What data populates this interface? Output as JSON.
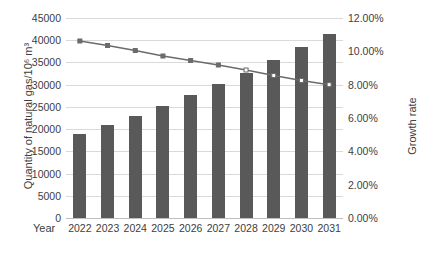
{
  "chart_data": {
    "type": "bar",
    "title": "",
    "xlabel": "Year",
    "ylabel": "Quantity of natural gas/10⁶ m³",
    "y2label": "Growth rate",
    "categories": [
      "2022",
      "2023",
      "2024",
      "2025",
      "2026",
      "2027",
      "2028",
      "2029",
      "2030",
      "2031"
    ],
    "ylim": [
      0,
      45000
    ],
    "y2lim": [
      0,
      0.12
    ],
    "yticks": [
      "0",
      "5000",
      "10000",
      "15000",
      "20000",
      "25000",
      "30000",
      "35000",
      "40000",
      "45000"
    ],
    "y2ticks": [
      "0.00%",
      "2.00%",
      "4.00%",
      "6.00%",
      "8.00%",
      "10.00%",
      "12.00%"
    ],
    "grid": true,
    "legend": "none",
    "series": [
      {
        "name": "Quantity of natural gas",
        "type": "bar",
        "axis": "left",
        "color": "#595959",
        "values": [
          19000,
          21000,
          23000,
          25200,
          27700,
          30200,
          32700,
          35600,
          38400,
          41500
        ]
      },
      {
        "name": "Growth rate",
        "type": "line",
        "axis": "right",
        "color": "#6b6b6b",
        "values": [
          0.1062,
          0.1035,
          0.1005,
          0.0972,
          0.0945,
          0.0918,
          0.0888,
          0.0855,
          0.0825,
          0.08
        ]
      }
    ]
  },
  "axes": {
    "x_title": "Year",
    "y_left_title": "Quantity of natural gas/10⁶ m³",
    "y_right_title": "Growth rate"
  }
}
